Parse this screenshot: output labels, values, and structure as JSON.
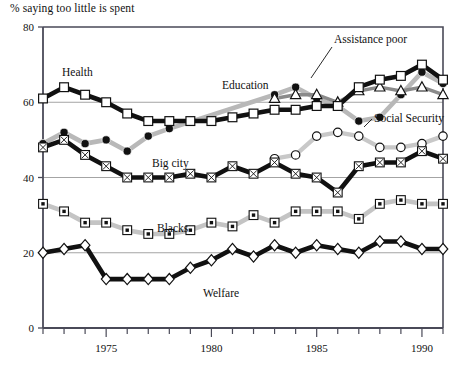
{
  "chart_title": "% saying too little is spent",
  "axes": {
    "y_label": "",
    "y_ticks": [
      0,
      20,
      40,
      60,
      80
    ],
    "ylim": [
      0,
      80
    ],
    "x_label": "",
    "x_ticks_major": [
      1975,
      1980,
      1985,
      1990
    ],
    "xlim": [
      1972,
      1991
    ],
    "grid": "horizontal",
    "tick_every_year": true
  },
  "series_labels": {
    "health": "Health",
    "education": "Education",
    "assistance_poor": "Assistance poor",
    "social_security": "Social Security",
    "big_city": "Big city",
    "blacks": "Blacks",
    "welfare": "Welfare"
  },
  "chart_data": {
    "type": "line",
    "title": "% saying too little is spent",
    "xlabel": "",
    "ylabel": "% saying too little is spent",
    "ylim": [
      0,
      80
    ],
    "xlim": [
      1972,
      1991
    ],
    "grid": true,
    "legend": "inline-labels",
    "x": [
      1972,
      1973,
      1974,
      1975,
      1976,
      1977,
      1978,
      1979,
      1980,
      1981,
      1982,
      1983,
      1984,
      1985,
      1986,
      1987,
      1988,
      1989,
      1990,
      1991
    ],
    "series": [
      {
        "name": "Health",
        "marker": "open-square",
        "line_color": "#111111",
        "line_style": "thick-black",
        "values": [
          61,
          64,
          62,
          60,
          57,
          55,
          55,
          55,
          55,
          56,
          57,
          58,
          58,
          59,
          59,
          64,
          66,
          67,
          70,
          66
        ]
      },
      {
        "name": "Education",
        "marker": "filled-circle",
        "line_color": "#b8b8b8",
        "line_style": "thick-gray",
        "values": [
          49,
          52,
          49,
          50,
          47,
          51,
          53,
          null,
          null,
          null,
          null,
          62,
          64,
          61,
          59,
          55,
          56,
          62,
          68,
          65
        ]
      },
      {
        "name": "Assistance poor",
        "marker": "open-triangle",
        "line_color": "#8a8a8a",
        "line_style": "medium-gray",
        "values": [
          null,
          null,
          null,
          null,
          null,
          null,
          null,
          null,
          null,
          null,
          null,
          61,
          62,
          62,
          60,
          63,
          64,
          63,
          64,
          62
        ]
      },
      {
        "name": "Social Security",
        "marker": "open-circle",
        "line_color": "#c8c8c8",
        "line_style": "thick-gray",
        "values": [
          null,
          null,
          null,
          null,
          null,
          null,
          null,
          null,
          null,
          null,
          null,
          45,
          46,
          51,
          52,
          51,
          48,
          48,
          49,
          51
        ]
      },
      {
        "name": "Big city",
        "marker": "crossed-square",
        "line_color": "#111111",
        "line_style": "thick-black",
        "values": [
          48,
          50,
          46,
          43,
          40,
          40,
          40,
          41,
          40,
          43,
          41,
          44,
          41,
          40,
          36,
          43,
          44,
          44,
          47,
          45
        ]
      },
      {
        "name": "Blacks",
        "marker": "dotted-square",
        "line_color": "#c4c4c4",
        "line_style": "thick-gray",
        "values": [
          33,
          31,
          28,
          28,
          26,
          25,
          25,
          26,
          28,
          27,
          30,
          28,
          31,
          31,
          31,
          29,
          33,
          34,
          33,
          33
        ]
      },
      {
        "name": "Welfare",
        "marker": "open-diamond",
        "line_color": "#111111",
        "line_style": "thick-black",
        "values": [
          20,
          21,
          22,
          13,
          13,
          13,
          13,
          16,
          18,
          21,
          19,
          22,
          20,
          22,
          21,
          20,
          23,
          23,
          21,
          21
        ]
      }
    ]
  }
}
